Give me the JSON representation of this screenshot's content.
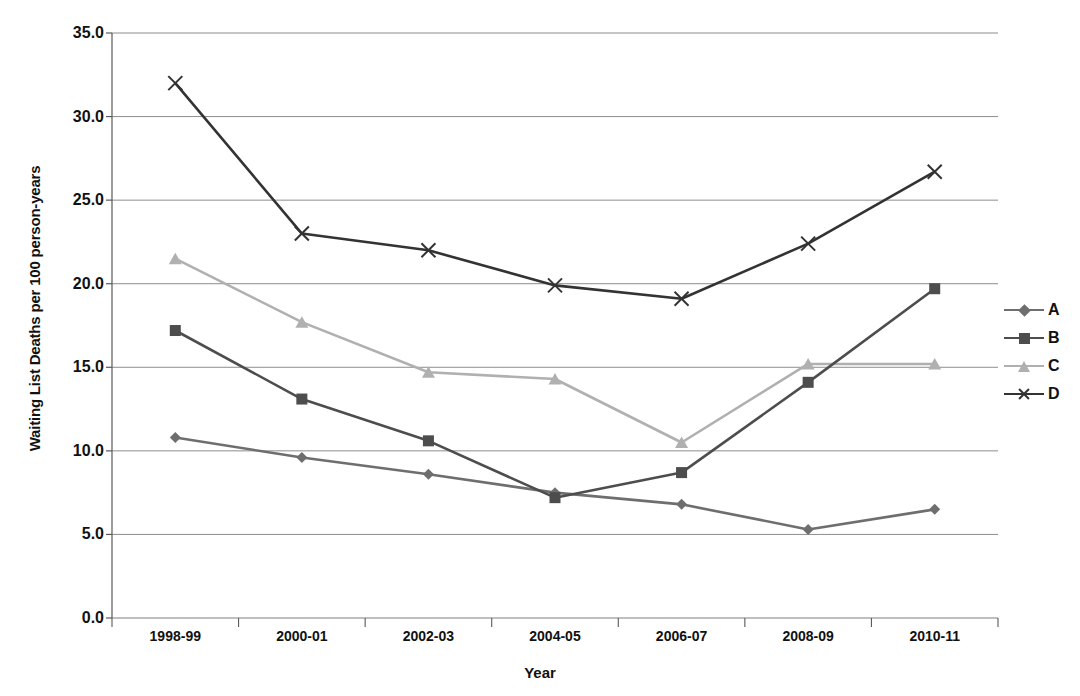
{
  "chart_data": {
    "type": "line",
    "title": "",
    "xlabel": "Year",
    "ylabel": "Waiting List Deaths per 100 person-years",
    "categories": [
      "1998-99",
      "2000-01",
      "2002-03",
      "2004-05",
      "2006-07",
      "2008-09",
      "2010-11"
    ],
    "ylim": [
      0.0,
      35.0
    ],
    "yticks": [
      "0.0",
      "5.0",
      "10.0",
      "15.0",
      "20.0",
      "25.0",
      "30.0",
      "35.0"
    ],
    "ytick_values": [
      0.0,
      5.0,
      10.0,
      15.0,
      20.0,
      25.0,
      30.0,
      35.0
    ],
    "grid": true,
    "legend_position": "right",
    "series": [
      {
        "name": "A",
        "marker": "diamond",
        "color": "#6e6e6e",
        "values": [
          10.8,
          9.6,
          8.6,
          7.5,
          6.8,
          5.3,
          6.5
        ]
      },
      {
        "name": "B",
        "marker": "square",
        "color": "#4d4d4d",
        "values": [
          17.2,
          13.1,
          10.6,
          7.2,
          8.7,
          14.1,
          19.7
        ]
      },
      {
        "name": "C",
        "marker": "triangle",
        "color": "#b0b0b0",
        "values": [
          21.5,
          17.7,
          14.7,
          14.3,
          10.5,
          15.2,
          15.2
        ]
      },
      {
        "name": "D",
        "marker": "x",
        "color": "#333333",
        "values": [
          32.0,
          23.0,
          22.0,
          19.9,
          19.1,
          22.4,
          26.7
        ]
      }
    ]
  },
  "axes": {
    "x_title": "Year",
    "y_title": "Waiting List Deaths per 100 person-years"
  },
  "legend": {
    "items": [
      {
        "label": "A"
      },
      {
        "label": "B"
      },
      {
        "label": "C"
      },
      {
        "label": "D"
      }
    ]
  },
  "colors": {
    "grid": "#808080",
    "axis": "#595959",
    "text": "#111111",
    "background": "#ffffff"
  }
}
